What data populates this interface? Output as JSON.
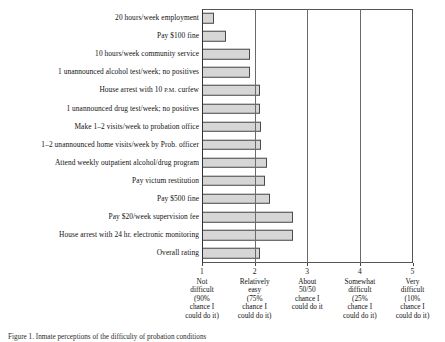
{
  "chart_data": {
    "type": "bar",
    "orientation": "horizontal",
    "title": "",
    "xlabel": "",
    "ylabel": "",
    "xlim": [
      1,
      5
    ],
    "grid": true,
    "gridlines": [
      2,
      3,
      4
    ],
    "legend": "none",
    "bar_color": "#d6d6d6",
    "bar_edge_color": "#4a4a4a",
    "categories": [
      "20 hours/week employment",
      "Pay $100 fine",
      "10 hours/week community service",
      "1 unannounced alcohol test/week; no positives",
      "House arrest with 10 P.M. curfew",
      "1 unannounced drug test/week; no positives",
      "Make 1–2 visits/week to probation office",
      "1–2 unannounced home visits/week by Prob. officer",
      "Attend weekly outpatient alcohol/drug program",
      "Pay victum restitution",
      "Pay $500 fine",
      "Pay $20/week supervision fee",
      "House arrest with 24 hr. electronic monitoring",
      "Overall rating"
    ],
    "values": [
      1.23,
      1.45,
      1.91,
      1.91,
      2.1,
      2.1,
      2.12,
      2.12,
      2.23,
      2.2,
      2.29,
      2.73,
      2.73,
      2.1
    ],
    "xticks": [
      1,
      2,
      3,
      4,
      5
    ],
    "xticklabels": [
      {
        "num": "1",
        "lines": [
          "Not",
          "difficult",
          "(90%",
          "chance I",
          "could do it)"
        ]
      },
      {
        "num": "2",
        "lines": [
          "Relatively",
          "easy",
          "(75%",
          "chance I",
          "could do it)"
        ]
      },
      {
        "num": "3",
        "lines": [
          "About",
          "50/50",
          "chance I",
          "could do it"
        ]
      },
      {
        "num": "4",
        "lines": [
          "Somewhat",
          "difficult",
          "(25%",
          "chance I",
          "could do it)"
        ]
      },
      {
        "num": "5",
        "lines": [
          "Very",
          "difficult",
          "(10%",
          "chance I",
          "could do it)"
        ]
      }
    ]
  },
  "caption": {
    "text": "Figure 1. Inmate perceptions of the difficulty of probation conditions"
  }
}
